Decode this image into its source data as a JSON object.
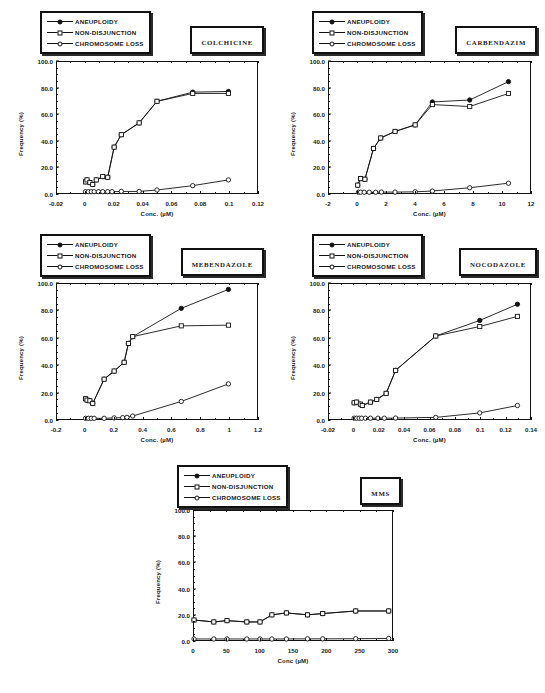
{
  "figure": {
    "axis_titles": {
      "x": "Conc. (µM)",
      "y": "Frequency (%)"
    },
    "legend_entries": [
      {
        "label": "ANEUPLOIDY",
        "marker": "filled-circle"
      },
      {
        "label": "NON-DISJUNCTION",
        "marker": "open-square"
      },
      {
        "label": "CHROMOSOME LOSS",
        "marker": "open-circle"
      }
    ]
  },
  "panels": [
    {
      "id": "colchicine",
      "title": "COLCHICINE",
      "xlabel": "Conc. (µM)",
      "ylabel": "Frequency (%)",
      "xticks": [
        "-0.02",
        "0",
        "0.02",
        "0.04",
        "0.06",
        "0.08",
        "0.1",
        "0.12"
      ],
      "yticks": [
        "0.0",
        "20.0",
        "40.0",
        "60.0",
        "80.0",
        "100.0"
      ]
    },
    {
      "id": "carbendazim",
      "title": "CARBENDAZIM",
      "xlabel": "Conc. (µM)",
      "ylabel": "Frequency (%)",
      "xticks": [
        "-2",
        "0",
        "2",
        "4",
        "6",
        "8",
        "10",
        "12"
      ],
      "yticks": [
        "0.0",
        "20.0",
        "40.0",
        "60.0",
        "80.0",
        "100.0"
      ]
    },
    {
      "id": "mebendazole",
      "title": "MEBENDAZOLE",
      "xlabel": "Conc. (µM)",
      "ylabel": "Frequency (%)",
      "xticks": [
        "-0.2",
        "0",
        "0.2",
        "0.4",
        "0.6",
        "0.8",
        "1",
        "1.2"
      ],
      "yticks": [
        "0.0",
        "20.0",
        "40.0",
        "60.0",
        "80.0",
        "100.0"
      ]
    },
    {
      "id": "nocodazole",
      "title": "NOCODAZOLE",
      "xlabel": "Conc. (µM)",
      "ylabel": "Frequency (%)",
      "xticks": [
        "-0.02",
        "0",
        "0.02",
        "0.04",
        "0.06",
        "0.08",
        "0.1",
        "0.12",
        "0.14"
      ],
      "yticks": [
        "0.0",
        "20.0",
        "40.0",
        "60.0",
        "80.0",
        "100.0"
      ]
    },
    {
      "id": "mms",
      "title": "MMS",
      "xlabel": "Conc (µM)",
      "ylabel": "Frequency (%)",
      "xticks": [
        "0",
        "50",
        "100",
        "150",
        "200",
        "250",
        "300"
      ],
      "yticks": [
        "0.0",
        "20.0",
        "40.0",
        "60.0",
        "80.0",
        "100.0"
      ]
    }
  ],
  "chart_data": [
    {
      "type": "line",
      "title": "COLCHICINE",
      "xlabel": "Conc. (µM)",
      "ylabel": "Frequency (%)",
      "xlim": [
        -0.02,
        0.12
      ],
      "ylim": [
        0.0,
        100.0
      ],
      "grid": false,
      "legend_position": "top-left",
      "series": [
        {
          "name": "ANEUPLOIDY",
          "marker": "filled-circle",
          "x": [
            0.0,
            0.001,
            0.003,
            0.005,
            0.0075,
            0.012,
            0.0155,
            0.02,
            0.025,
            0.0375,
            0.05,
            0.075,
            0.1
          ],
          "y": [
            8.5,
            10.0,
            8.0,
            6.5,
            10.0,
            12.5,
            12.0,
            35.0,
            44.5,
            53.5,
            70.0,
            77.0,
            77.5
          ]
        },
        {
          "name": "NON-DISJUNCTION",
          "marker": "open-square",
          "x": [
            0.0,
            0.001,
            0.003,
            0.005,
            0.0075,
            0.012,
            0.0155,
            0.02,
            0.025,
            0.0375,
            0.05,
            0.075,
            0.1
          ],
          "y": [
            8.5,
            10.0,
            8.0,
            6.5,
            10.0,
            12.5,
            12.0,
            35.0,
            44.5,
            53.5,
            70.0,
            76.0,
            76.0
          ]
        },
        {
          "name": "CHROMOSOME LOSS",
          "marker": "open-circle",
          "x": [
            0.0,
            0.002,
            0.004,
            0.006,
            0.009,
            0.012,
            0.0155,
            0.0185,
            0.025,
            0.0375,
            0.05,
            0.075,
            0.1
          ],
          "y": [
            1.0,
            1.0,
            1.0,
            1.0,
            1.0,
            1.0,
            1.0,
            1.0,
            1.2,
            1.2,
            2.3,
            5.6,
            10.0
          ]
        }
      ]
    },
    {
      "type": "line",
      "title": "CARBENDAZIM",
      "xlabel": "Conc. (µM)",
      "ylabel": "Frequency (%)",
      "xlim": [
        -2,
        12
      ],
      "ylim": [
        0.0,
        100.0
      ],
      "grid": false,
      "legend_position": "top-left",
      "series": [
        {
          "name": "ANEUPLOIDY",
          "marker": "filled-circle",
          "x": [
            0.0,
            0.2,
            0.5,
            1.1,
            1.6,
            2.6,
            4.0,
            5.2,
            7.8,
            10.5
          ],
          "y": [
            6.0,
            11.0,
            10.5,
            34.0,
            42.0,
            47.0,
            52.0,
            69.5,
            71.0,
            85.0
          ]
        },
        {
          "name": "NON-DISJUNCTION",
          "marker": "open-square",
          "x": [
            0.0,
            0.2,
            0.5,
            1.1,
            1.6,
            2.6,
            4.0,
            5.2,
            7.8,
            10.5
          ],
          "y": [
            6.0,
            11.0,
            10.5,
            34.0,
            42.0,
            47.0,
            52.0,
            67.5,
            66.0,
            76.0
          ]
        },
        {
          "name": "CHROMOSOME LOSS",
          "marker": "open-circle",
          "x": [
            0.05,
            0.2,
            0.45,
            0.8,
            1.25,
            1.65,
            2.6,
            4.0,
            5.2,
            7.8,
            10.5
          ],
          "y": [
            0.6,
            0.6,
            0.6,
            0.6,
            0.6,
            0.7,
            0.7,
            0.9,
            1.5,
            4.0,
            7.5
          ]
        }
      ]
    },
    {
      "type": "line",
      "title": "MEBENDAZOLE",
      "xlabel": "Conc. (µM)",
      "ylabel": "Frequency (%)",
      "xlim": [
        -0.2,
        1.2
      ],
      "ylim": [
        0.0,
        100.0
      ],
      "grid": false,
      "legend_position": "top-left",
      "series": [
        {
          "name": "ANEUPLOIDY",
          "marker": "filled-circle",
          "x": [
            0.0,
            0.01,
            0.03,
            0.05,
            0.13,
            0.2,
            0.27,
            0.3,
            0.33,
            0.67,
            1.0
          ],
          "y": [
            15.0,
            14.0,
            13.5,
            11.5,
            29.5,
            35.5,
            42.0,
            56.0,
            61.0,
            82.0,
            96.0
          ]
        },
        {
          "name": "NON-DISJUNCTION",
          "marker": "open-square",
          "x": [
            0.0,
            0.01,
            0.03,
            0.05,
            0.13,
            0.2,
            0.27,
            0.3,
            0.33,
            0.67,
            1.0
          ],
          "y": [
            15.0,
            14.0,
            13.5,
            11.5,
            29.5,
            35.5,
            42.0,
            56.0,
            61.0,
            69.0,
            69.5
          ]
        },
        {
          "name": "CHROMOSOME LOSS",
          "marker": "open-circle",
          "x": [
            0.0,
            0.02,
            0.04,
            0.06,
            0.13,
            0.2,
            0.26,
            0.29,
            0.33,
            0.67,
            1.0
          ],
          "y": [
            0.5,
            0.5,
            0.5,
            0.5,
            0.5,
            0.8,
            1.0,
            1.2,
            2.2,
            13.0,
            26.0
          ]
        }
      ]
    },
    {
      "type": "line",
      "title": "NOCODAZOLE",
      "xlabel": "Conc. (µM)",
      "ylabel": "Frequency (%)",
      "xlim": [
        -0.02,
        0.14
      ],
      "ylim": [
        0.0,
        100.0
      ],
      "grid": false,
      "legend_position": "top-left",
      "series": [
        {
          "name": "ANEUPLOIDY",
          "marker": "filled-circle",
          "x": [
            0.0,
            0.002,
            0.005,
            0.0065,
            0.013,
            0.018,
            0.0255,
            0.033,
            0.065,
            0.1,
            0.13
          ],
          "y": [
            12.0,
            12.5,
            11.0,
            10.0,
            12.5,
            14.5,
            19.0,
            36.0,
            61.5,
            73.0,
            85.0
          ]
        },
        {
          "name": "NON-DISJUNCTION",
          "marker": "open-square",
          "x": [
            0.0,
            0.002,
            0.005,
            0.0065,
            0.013,
            0.018,
            0.0255,
            0.033,
            0.065,
            0.1,
            0.13
          ],
          "y": [
            12.0,
            12.5,
            11.0,
            10.0,
            12.5,
            14.5,
            19.0,
            36.0,
            61.5,
            68.5,
            76.0
          ]
        },
        {
          "name": "CHROMOSOME LOSS",
          "marker": "open-circle",
          "x": [
            0.0,
            0.002,
            0.004,
            0.006,
            0.009,
            0.013,
            0.019,
            0.024,
            0.033,
            0.065,
            0.1,
            0.13
          ],
          "y": [
            0.6,
            0.6,
            0.6,
            0.6,
            0.6,
            0.6,
            0.6,
            0.6,
            0.7,
            1.2,
            4.5,
            10.0
          ]
        }
      ]
    },
    {
      "type": "line",
      "title": "MMS",
      "xlabel": "Conc (µM)",
      "ylabel": "Frequency (%)",
      "xlim": [
        0,
        300
      ],
      "ylim": [
        0.0,
        100.0
      ],
      "grid": false,
      "legend_position": "top-left",
      "series": [
        {
          "name": "ANEUPLOIDY",
          "marker": "filled-circle",
          "x": [
            0,
            30,
            50,
            80,
            100,
            118,
            140,
            172,
            195,
            245,
            295
          ],
          "y": [
            15.5,
            14.0,
            15.0,
            14.0,
            14.0,
            19.5,
            21.0,
            19.5,
            20.5,
            22.5,
            22.5
          ]
        },
        {
          "name": "NON-DISJUNCTION",
          "marker": "open-square",
          "x": [
            0,
            30,
            50,
            80,
            100,
            118,
            140,
            172,
            195,
            245,
            295
          ],
          "y": [
            15.5,
            14.0,
            15.0,
            14.0,
            14.0,
            19.5,
            21.0,
            19.5,
            20.5,
            22.5,
            22.5
          ]
        },
        {
          "name": "CHROMOSOME LOSS",
          "marker": "open-circle",
          "x": [
            0,
            30,
            50,
            80,
            100,
            118,
            140,
            172,
            195,
            245,
            295
          ],
          "y": [
            0.8,
            0.8,
            0.8,
            0.8,
            0.8,
            0.8,
            0.8,
            0.9,
            0.9,
            1.0,
            1.2
          ]
        }
      ]
    }
  ]
}
